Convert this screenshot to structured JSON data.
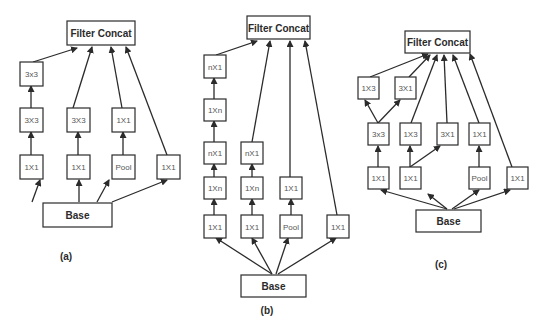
{
  "diagrams": [
    {
      "id": "a",
      "caption": "(a)",
      "caption_pos": [
        66,
        260
      ],
      "nodes": [
        {
          "id": "concat",
          "label": "Filter Concat",
          "x": 67,
          "y": 21,
          "w": 68,
          "h": 24,
          "big": true
        },
        {
          "id": "c1r1",
          "label": "3x3",
          "x": 20,
          "y": 62,
          "w": 23,
          "h": 24
        },
        {
          "id": "c1r2",
          "label": "3X3",
          "x": 20,
          "y": 108,
          "w": 23,
          "h": 24
        },
        {
          "id": "c2r2",
          "label": "3X3",
          "x": 67,
          "y": 108,
          "w": 23,
          "h": 24
        },
        {
          "id": "c3r2",
          "label": "1X1",
          "x": 112,
          "y": 108,
          "w": 23,
          "h": 24
        },
        {
          "id": "c1r3",
          "label": "1X1",
          "x": 20,
          "y": 155,
          "w": 23,
          "h": 24
        },
        {
          "id": "c2r3",
          "label": "1X1",
          "x": 67,
          "y": 155,
          "w": 23,
          "h": 24
        },
        {
          "id": "c3r3",
          "label": "Pool",
          "x": 112,
          "y": 155,
          "w": 23,
          "h": 24
        },
        {
          "id": "c4r3",
          "label": "1X1",
          "x": 157,
          "y": 155,
          "w": 23,
          "h": 24
        },
        {
          "id": "base",
          "label": "Base",
          "x": 43,
          "y": 203,
          "w": 69,
          "h": 24,
          "big": true
        }
      ],
      "edges": [
        [
          32,
          202,
          40,
          180
        ],
        [
          79,
          202,
          79,
          180
        ],
        [
          97,
          202,
          109,
          180
        ],
        [
          112,
          202,
          167,
          180
        ],
        [
          31,
          155,
          31,
          132
        ],
        [
          78,
          155,
          78,
          132
        ],
        [
          123,
          155,
          123,
          132
        ],
        [
          31,
          108,
          31,
          86
        ],
        [
          33,
          62,
          77,
          48
        ],
        [
          73,
          108,
          92,
          47
        ],
        [
          122,
          108,
          111,
          47
        ],
        [
          167,
          155,
          126,
          47
        ]
      ]
    },
    {
      "id": "b",
      "caption": "(b)",
      "caption_pos": [
        267,
        314
      ],
      "nodes": [
        {
          "id": "concat",
          "label": "Filter Concat",
          "x": 247,
          "y": 16,
          "w": 63,
          "h": 23,
          "big": true
        },
        {
          "id": "c1r1",
          "label": "nX1",
          "x": 204,
          "y": 55,
          "w": 22,
          "h": 23
        },
        {
          "id": "c1r2",
          "label": "1Xn",
          "x": 204,
          "y": 99,
          "w": 22,
          "h": 22
        },
        {
          "id": "c1r3",
          "label": "nX1",
          "x": 204,
          "y": 142,
          "w": 22,
          "h": 22
        },
        {
          "id": "c2r3",
          "label": "nX1",
          "x": 241,
          "y": 142,
          "w": 22,
          "h": 22
        },
        {
          "id": "c1r4",
          "label": "1Xn",
          "x": 204,
          "y": 177,
          "w": 22,
          "h": 22
        },
        {
          "id": "c2r4",
          "label": "1Xn",
          "x": 241,
          "y": 177,
          "w": 22,
          "h": 22
        },
        {
          "id": "c3r4",
          "label": "1X1",
          "x": 280,
          "y": 177,
          "w": 22,
          "h": 22
        },
        {
          "id": "c1r5",
          "label": "1X1",
          "x": 204,
          "y": 215,
          "w": 22,
          "h": 23
        },
        {
          "id": "c2r5",
          "label": "1X1",
          "x": 241,
          "y": 215,
          "w": 22,
          "h": 23
        },
        {
          "id": "c3r5",
          "label": "Pool",
          "x": 280,
          "y": 215,
          "w": 22,
          "h": 23
        },
        {
          "id": "c4r5",
          "label": "1X1",
          "x": 327,
          "y": 215,
          "w": 22,
          "h": 23
        },
        {
          "id": "base",
          "label": "Base",
          "x": 241,
          "y": 275,
          "w": 65,
          "h": 22,
          "big": true
        }
      ],
      "edges": [
        [
          272,
          274,
          216,
          238
        ],
        [
          272,
          274,
          252,
          238
        ],
        [
          276,
          274,
          288,
          238
        ],
        [
          278,
          274,
          336,
          238
        ],
        [
          214,
          215,
          214,
          199
        ],
        [
          252,
          215,
          252,
          199
        ],
        [
          291,
          215,
          291,
          199
        ],
        [
          214,
          177,
          214,
          164
        ],
        [
          252,
          177,
          252,
          164
        ],
        [
          214,
          142,
          214,
          121
        ],
        [
          214,
          99,
          214,
          78
        ],
        [
          216,
          55,
          257,
          41
        ],
        [
          252,
          142,
          270,
          41
        ],
        [
          290,
          177,
          290,
          41
        ],
        [
          337,
          215,
          305,
          41
        ]
      ]
    },
    {
      "id": "c",
      "caption": "(c)",
      "caption_pos": [
        441,
        268
      ],
      "nodes": [
        {
          "id": "concat",
          "label": "Filter Concat",
          "x": 405,
          "y": 31,
          "w": 65,
          "h": 22,
          "big": true
        },
        {
          "id": "c1r1",
          "label": "1X3",
          "x": 358,
          "y": 77,
          "w": 21,
          "h": 22
        },
        {
          "id": "c2r1",
          "label": "3X1",
          "x": 395,
          "y": 77,
          "w": 21,
          "h": 22
        },
        {
          "id": "c1r2",
          "label": "3x3",
          "x": 368,
          "y": 123,
          "w": 21,
          "h": 22
        },
        {
          "id": "c2r2",
          "label": "1X3",
          "x": 400,
          "y": 123,
          "w": 21,
          "h": 22
        },
        {
          "id": "c3r2",
          "label": "3X1",
          "x": 437,
          "y": 123,
          "w": 21,
          "h": 22
        },
        {
          "id": "c4r2",
          "label": "1X1",
          "x": 469,
          "y": 123,
          "w": 21,
          "h": 22
        },
        {
          "id": "c1r3",
          "label": "1X1",
          "x": 368,
          "y": 167,
          "w": 21,
          "h": 22
        },
        {
          "id": "c2r3",
          "label": "1X1",
          "x": 400,
          "y": 167,
          "w": 21,
          "h": 22
        },
        {
          "id": "c4r3",
          "label": "Pool",
          "x": 469,
          "y": 167,
          "w": 21,
          "h": 22
        },
        {
          "id": "c5r3",
          "label": "1X1",
          "x": 507,
          "y": 167,
          "w": 21,
          "h": 22
        },
        {
          "id": "base",
          "label": "Base",
          "x": 416,
          "y": 210,
          "w": 65,
          "h": 22,
          "big": true
        }
      ],
      "edges": [
        [
          447,
          209,
          381,
          190
        ],
        [
          447,
          209,
          428,
          194
        ],
        [
          452,
          209,
          479,
          190
        ],
        [
          454,
          209,
          510,
          190
        ],
        [
          378,
          167,
          378,
          146
        ],
        [
          410,
          167,
          410,
          146
        ],
        [
          410,
          167,
          440,
          146
        ],
        [
          479,
          167,
          479,
          146
        ],
        [
          378,
          123,
          365,
          100
        ],
        [
          378,
          123,
          400,
          100
        ],
        [
          370,
          77,
          428,
          54
        ],
        [
          409,
          77,
          430,
          55
        ],
        [
          411,
          123,
          437,
          55
        ],
        [
          447,
          123,
          444,
          55
        ],
        [
          479,
          123,
          453,
          55
        ],
        [
          512,
          167,
          470,
          54
        ]
      ]
    }
  ],
  "colors": {
    "stroke": "#2b2b2b",
    "box_fill": "#ffffff",
    "small_text": "#555555",
    "background": "#ffffff"
  }
}
